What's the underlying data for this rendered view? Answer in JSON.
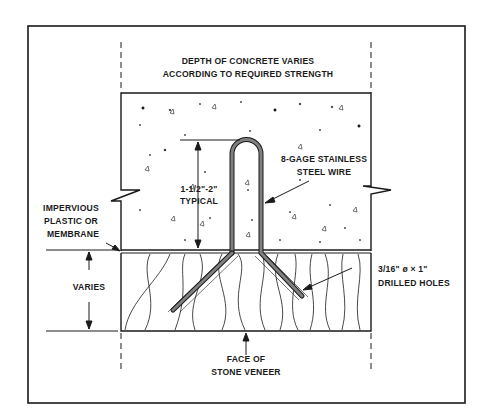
{
  "diagram": {
    "labels": {
      "concrete_depth_line1": "DEPTH OF CONCRETE VARIES",
      "concrete_depth_line2": "ACCORDING TO REQUIRED STRENGTH",
      "wire_line1": "8-GAGE STAINLESS",
      "wire_line2": "STEEL WIRE",
      "typical_line1": "1-1/2\"-2\"",
      "typical_line2": "TYPICAL",
      "membrane_line1": "IMPERVIOUS",
      "membrane_line2": "PLASTIC  OR",
      "membrane_line3": "MEMBRANE",
      "varies": "VARIES",
      "holes_line1": "3/16\" ø  ×  1\"",
      "holes_line2": "DRILLED HOLES",
      "face_line1": "FACE OF",
      "face_line2": "STONE VENEER"
    },
    "components": [
      {
        "name": "concrete",
        "description": "Concrete backing layer with aggregate speckle pattern"
      },
      {
        "name": "membrane",
        "description": "Impervious plastic or membrane layer between concrete and stone"
      },
      {
        "name": "stone-veneer",
        "description": "Stone veneer layer with wavy grain lines"
      },
      {
        "name": "anchor-wire",
        "description": "U-shaped 8-gage stainless steel wire looped into concrete, legs bent into drilled holes in stone"
      }
    ],
    "colors": {
      "ink": "#1a1a1a",
      "wire_fill": "#808080",
      "background": "#ffffff"
    }
  }
}
